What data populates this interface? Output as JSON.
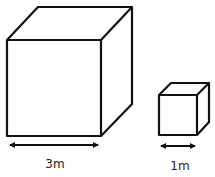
{
  "diagram": {
    "large_cube": {
      "label": "3m",
      "stroke": "#111111"
    },
    "small_cube": {
      "label": "1m",
      "stroke": "#111111"
    }
  }
}
